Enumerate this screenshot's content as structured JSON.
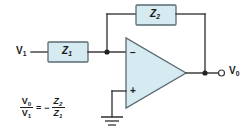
{
  "diagram": {
    "fill_color": "#d6eaf1",
    "wire_color": "#3c3c3c",
    "background": "#ffffff"
  },
  "components": {
    "input_impedance": {
      "label": "Z",
      "subscript": "1",
      "name": "Z1"
    },
    "feedback_impedance": {
      "label": "Z",
      "subscript": "2",
      "name": "Z2"
    },
    "opamp": {
      "inverting_sign": "−",
      "noninverting_sign": "+"
    }
  },
  "terminals": {
    "input": {
      "label": "V",
      "subscript": "1"
    },
    "output": {
      "label": "V",
      "subscript": "0"
    }
  },
  "ground": {
    "name": "ground-symbol"
  },
  "equation": {
    "numerator_left": "V",
    "numerator_left_sub": "0",
    "denominator_left": "V",
    "denominator_left_sub": "1",
    "equals": "=",
    "negative": "−",
    "numerator_right": "Z",
    "numerator_right_sub": "2",
    "denominator_right": "Z",
    "denominator_right_sub": "1",
    "full_text": "V0/V1 = - Z2/Z1"
  }
}
